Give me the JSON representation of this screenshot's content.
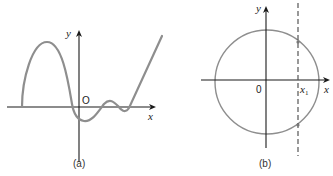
{
  "panels": [
    {
      "id": "a",
      "caption": "(a)",
      "x_label": "x",
      "y_label": "y",
      "origin_label": "O",
      "description": "Graph of a function curve crossing x-axis; large hump on left, dip below origin, small bump, then rising line"
    },
    {
      "id": "b",
      "caption": "(b)",
      "x_label": "x",
      "y_label": "y",
      "origin_label": "0",
      "x1_label": "x",
      "x1_subscript": "1",
      "description": "Circle centered at origin with vertical dashed line at x = x1 intersecting circle at two points"
    }
  ],
  "colors": {
    "curve": "#8e8e8e",
    "axis": "#1a1a1a",
    "dash": "#555555"
  }
}
